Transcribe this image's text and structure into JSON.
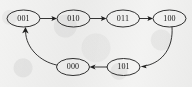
{
  "figure": {
    "background_color": "#f3f3f2",
    "stroke_color": "#1f1f1f",
    "label_color": "#151515",
    "nodes": [
      {
        "id": "n001",
        "label": "001",
        "cx": 23.5,
        "cy": 18.5,
        "rx": 16.5,
        "ry": 8.5
      },
      {
        "id": "n010",
        "label": "010",
        "cx": 73.5,
        "cy": 18.5,
        "rx": 16.5,
        "ry": 8.5
      },
      {
        "id": "n011",
        "label": "011",
        "cx": 123.0,
        "cy": 18.5,
        "rx": 16.5,
        "ry": 8.5
      },
      {
        "id": "n100",
        "label": "100",
        "cx": 169.5,
        "cy": 18.5,
        "rx": 16.5,
        "ry": 8.5
      },
      {
        "id": "n000",
        "label": "000",
        "cx": 73.0,
        "cy": 67.0,
        "rx": 16.5,
        "ry": 8.5
      },
      {
        "id": "n101",
        "label": "101",
        "cx": 123.5,
        "cy": 67.0,
        "rx": 16.5,
        "ry": 8.5
      }
    ],
    "edges": [
      {
        "id": "e1",
        "from": "001",
        "to": "010",
        "path": "M 40.5 18.5 L 54.5 18.5",
        "arrow": "M 57.0 18.5 L 51.4 16.0 L 52.6 18.5 L 51.4 21.0 Z",
        "shape": "straight"
      },
      {
        "id": "e2",
        "from": "010",
        "to": "011",
        "path": "M 90.5 18.5 L 103.6 18.5",
        "arrow": "M 106.5 18.5 L 100.9 16.0 L 102.1 18.5 L 100.9 21.0 Z",
        "shape": "straight"
      },
      {
        "id": "e3",
        "from": "011",
        "to": "100",
        "path": "M 139.5 18.5 L 150.2 18.5",
        "arrow": "M 153.0 18.5 L 147.4 16.0 L 148.6 18.5 L 147.4 21.0 Z",
        "shape": "straight"
      },
      {
        "id": "e4",
        "from": "100",
        "to": "101",
        "path": "M 172.0 27.2 C 173.5 47.0 163.0 62.0 146.5 65.6",
        "arrow": "M 140.5 66.6 L 147.2 64.6 L 145.6 66.2 L 146.6 68.3 Z",
        "shape": "curve"
      },
      {
        "id": "e5",
        "from": "101",
        "to": "000",
        "path": "M 107.0 67.0 L 94.0 67.0",
        "arrow": "M 89.5 67.0 L 95.6 64.5 L 94.0 67.0 L 95.6 69.5 Z",
        "shape": "straight"
      },
      {
        "id": "e6",
        "from": "000",
        "to": "001",
        "path": "M 56.5 65.0 C 40.0 61.5 26.0 48.0 25.6 32.0",
        "arrow": "M 25.5 26.9 L 22.2 33.2 L 25.5 31.7 L 28.6 33.4 Z",
        "shape": "curve"
      }
    ],
    "cycle_order": [
      "001",
      "010",
      "011",
      "100",
      "101",
      "000"
    ]
  }
}
